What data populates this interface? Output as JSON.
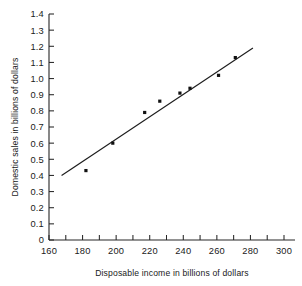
{
  "chart_data": {
    "type": "scatter",
    "title": "",
    "xlabel": "Disposable income in billions of dollars",
    "ylabel": "Domestic sales in billions of dollars",
    "xlim": [
      160,
      308
    ],
    "ylim": [
      0,
      1.4
    ],
    "grid": false,
    "legend": null,
    "x_ticks": [
      160,
      170,
      180,
      190,
      200,
      210,
      220,
      230,
      240,
      250,
      260,
      270,
      280,
      290,
      300
    ],
    "x_tick_labels": [
      "160",
      "",
      "180",
      "",
      "200",
      "",
      "220",
      "",
      "240",
      "",
      "260",
      "",
      "280",
      "",
      "300"
    ],
    "y_ticks": [
      0,
      0.1,
      0.2,
      0.3,
      0.4,
      0.5,
      0.6,
      0.7,
      0.8,
      0.9,
      1.0,
      1.1,
      1.2,
      1.3,
      1.4
    ],
    "y_tick_labels": [
      "0",
      "0.1",
      "0.2",
      "0.3",
      "0.4",
      "0.5",
      "0.6",
      "0.7",
      "0.8",
      "0.9",
      "1.0",
      "1.1",
      "1.2",
      "1.3",
      "1.4"
    ],
    "points": [
      {
        "x": 182,
        "y": 0.43
      },
      {
        "x": 198,
        "y": 0.6
      },
      {
        "x": 217,
        "y": 0.79
      },
      {
        "x": 226,
        "y": 0.86
      },
      {
        "x": 238,
        "y": 0.91
      },
      {
        "x": 244,
        "y": 0.94
      },
      {
        "x": 261,
        "y": 1.02
      },
      {
        "x": 271,
        "y": 1.13
      }
    ],
    "series": [
      {
        "name": "Domestic sales",
        "x": [
          182,
          198,
          217,
          226,
          238,
          244,
          261,
          271
        ],
        "values": [
          0.43,
          0.6,
          0.79,
          0.86,
          0.91,
          0.94,
          1.02,
          1.13
        ]
      }
    ],
    "fit_line": {
      "name": "regression line",
      "x_start": 167.5,
      "y_start": 0.4,
      "x_end": 281.5,
      "y_end": 1.19
    }
  }
}
